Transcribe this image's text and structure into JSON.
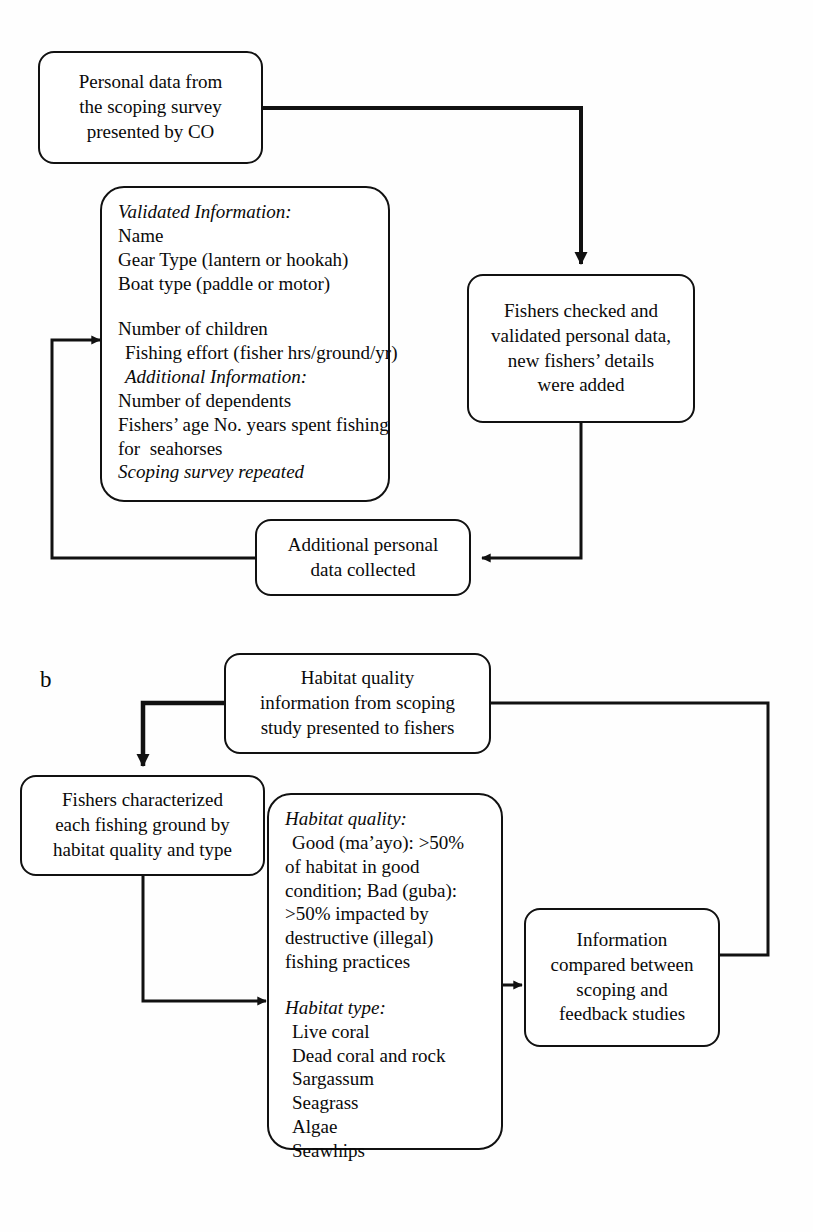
{
  "figure": {
    "panels": [
      {
        "id": "a",
        "label": "",
        "nodes": {
          "personal_data": "Personal data from\nthe scoping survey\npresented by CO",
          "fishers_checked": "Fishers checked and\nvalidated personal data,\nnew fishers’ details\nwere added",
          "additional_personal": "Additional personal\ndata collected"
        },
        "info_box": {
          "lines": [
            {
              "text": "Validated Information:",
              "style": "italic"
            },
            {
              "text": "Name",
              "style": "normal"
            },
            {
              "text": "Gear Type (lantern or hookah)",
              "style": "normal"
            },
            {
              "text": "Boat type (paddle or motor)",
              "style": "normal"
            },
            {
              "text": "",
              "style": "gap"
            },
            {
              "text": "Number of children",
              "style": "normal"
            },
            {
              "text": "Fishing effort (fisher hrs/ground/yr)",
              "style": "indent"
            },
            {
              "text": "Additional Information:",
              "style": "italic-indent"
            },
            {
              "text": "Number of dependents",
              "style": "normal"
            },
            {
              "text": "Fishers’ age No. years spent fishing",
              "style": "normal"
            },
            {
              "text": "for  seahorses",
              "style": "normal"
            },
            {
              "text": "Scoping survey repeated",
              "style": "italic"
            }
          ]
        }
      },
      {
        "id": "b",
        "label": "b",
        "nodes": {
          "habitat_quality_info": "Habitat quality\ninformation from scoping\nstudy presented to fishers",
          "fishers_characterized": "Fishers characterized\neach fishing ground by\nhabitat quality and type",
          "information_compared": "Information\ncompared between\nscoping and\nfeedback studies"
        },
        "habitat_box": {
          "lines": [
            {
              "text": "Habitat quality:",
              "style": "italic"
            },
            {
              "text": "Good (ma’ayo): >50%",
              "style": "indent"
            },
            {
              "text": "of habitat in good",
              "style": "normal"
            },
            {
              "text": "condition; Bad (guba):",
              "style": "normal"
            },
            {
              "text": ">50% impacted by",
              "style": "normal"
            },
            {
              "text": "destructive (illegal)",
              "style": "normal"
            },
            {
              "text": "fishing practices",
              "style": "normal"
            },
            {
              "text": "",
              "style": "gap"
            },
            {
              "text": "Habitat type:",
              "style": "italic"
            },
            {
              "text": "Live coral",
              "style": "indent"
            },
            {
              "text": "Dead coral and rock",
              "style": "indent"
            },
            {
              "text": "Sargassum",
              "style": "indent"
            },
            {
              "text": "Seagrass",
              "style": "indent"
            },
            {
              "text": "Algae",
              "style": "indent"
            },
            {
              "text": "Seawhips",
              "style": "indent"
            }
          ]
        }
      }
    ],
    "colors": {
      "stroke": "#111111",
      "background": "#ffffff",
      "text": "#0a0a0a"
    }
  }
}
